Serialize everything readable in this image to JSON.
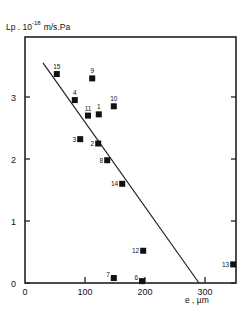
{
  "chart_data": {
    "type": "scatter",
    "title": "",
    "ylabel": "Lp . 10^-18 m/s.Pa",
    "ylabel_parts": {
      "base": "Lp . 10",
      "exp": "-18",
      "unit": "m/s.Pa"
    },
    "xlabel": "e , µm",
    "xlim": [
      0,
      350
    ],
    "ylim": [
      0,
      3.9
    ],
    "xticks": [
      0,
      100,
      200,
      300
    ],
    "yticks": [
      0,
      1,
      2,
      3
    ],
    "grid": false,
    "legend": null,
    "points": [
      {
        "label": "1",
        "x": 123,
        "y": 2.72
      },
      {
        "label": "2",
        "x": 122,
        "y": 2.25
      },
      {
        "label": "3",
        "x": 92,
        "y": 2.32
      },
      {
        "label": "4",
        "x": 83,
        "y": 2.95
      },
      {
        "label": "6",
        "x": 195,
        "y": 0.03
      },
      {
        "label": "7",
        "x": 148,
        "y": 0.08
      },
      {
        "label": "8",
        "x": 137,
        "y": 1.98
      },
      {
        "label": "9",
        "x": 112,
        "y": 3.3
      },
      {
        "label": "10",
        "x": 148,
        "y": 2.85
      },
      {
        "label": "11",
        "x": 105,
        "y": 2.7
      },
      {
        "label": "12",
        "x": 197,
        "y": 0.52
      },
      {
        "label": "13",
        "x": 347,
        "y": 0.3
      },
      {
        "label": "14",
        "x": 162,
        "y": 1.6
      },
      {
        "label": "15",
        "x": 53,
        "y": 3.37
      }
    ],
    "fit_line": {
      "x": [
        30,
        290
      ],
      "y": [
        3.55,
        0
      ]
    }
  }
}
